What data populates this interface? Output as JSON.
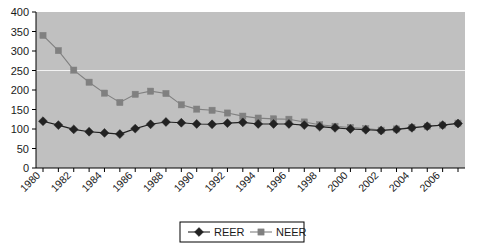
{
  "chart_data": {
    "type": "line",
    "title": "",
    "xlabel": "",
    "ylabel": "",
    "ylim": [
      0,
      400
    ],
    "ytick_step": 50,
    "yticks": [
      "0",
      "50",
      "100",
      "150",
      "200",
      "250",
      "300",
      "350",
      "400"
    ],
    "grid": "horizontal-gridline-at-250-only",
    "legend_position": "bottom-center",
    "plot_background": "#c0c0c0",
    "x": [
      1980,
      1981,
      1982,
      1983,
      1984,
      1985,
      1986,
      1987,
      1988,
      1989,
      1990,
      1991,
      1992,
      1993,
      1994,
      1995,
      1996,
      1997,
      1998,
      1999,
      2000,
      2001,
      2002,
      2003,
      2004,
      2005,
      2006,
      2007
    ],
    "xtick_labels": [
      "1980",
      "1982",
      "1984",
      "1986",
      "1988",
      "1990",
      "1992",
      "1994",
      "1996",
      "1998",
      "2000",
      "2002",
      "2004",
      "2006"
    ],
    "xtick_label_every": 2,
    "xtick_rotation_deg": 45,
    "series": [
      {
        "name": "REER",
        "color": "#222222",
        "marker": "diamond",
        "values": [
          120,
          110,
          99,
          93,
          90,
          87,
          101,
          112,
          118,
          116,
          113,
          112,
          115,
          117,
          113,
          113,
          113,
          110,
          106,
          103,
          100,
          98,
          96,
          99,
          103,
          107,
          110,
          114
        ]
      },
      {
        "name": "NEER",
        "color": "#808080",
        "marker": "square",
        "values": [
          340,
          301,
          251,
          220,
          192,
          168,
          189,
          197,
          191,
          162,
          151,
          148,
          141,
          133,
          128,
          126,
          125,
          118,
          111,
          107,
          104,
          101,
          97,
          100,
          104,
          107,
          110,
          115
        ]
      }
    ]
  },
  "legend": {
    "entries": [
      {
        "label": "REER",
        "marker": "diamond",
        "color": "#222222"
      },
      {
        "label": "NEER",
        "marker": "square",
        "color": "#808080"
      }
    ]
  }
}
